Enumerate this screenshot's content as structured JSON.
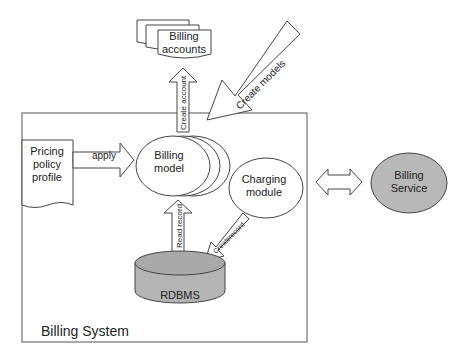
{
  "diagram": {
    "system_box": {
      "label": "Billing System"
    },
    "nodes": {
      "billing_accounts": {
        "line1": "Billing",
        "line2": "accounts"
      },
      "pricing_policy": {
        "line1": "Pricing",
        "line2": "policy",
        "line3": "profile"
      },
      "billing_model": {
        "line1": "Billing",
        "line2": "model"
      },
      "charging_module": {
        "line1": "Charging",
        "line2": "module"
      },
      "rdbms": {
        "label": "RDBMS"
      },
      "billing_service": {
        "line1": "Billing",
        "line2": "Service"
      }
    },
    "arrows": {
      "create_account": "Create account",
      "create_models": "Create models",
      "apply": "apply",
      "read_record": "Read record",
      "create_record": "Createrecord"
    },
    "colors": {
      "line": "#333333",
      "db_fill": "#b4b4b4",
      "db_top": "#a9a9a9",
      "service_fill": "#b8b8b8",
      "background": "#ffffff"
    }
  }
}
